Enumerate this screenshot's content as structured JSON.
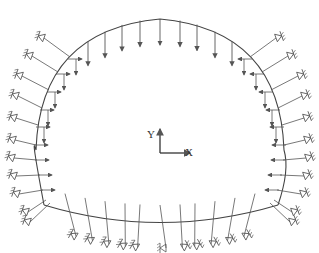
{
  "diagram": {
    "type": "tunnel-lining-load-model",
    "colors": {
      "stroke": "#555555",
      "lining": "#444444",
      "background": "#ffffff"
    },
    "axes": {
      "x_label": "X",
      "y_label": "Y",
      "origin": [
        160,
        153
      ],
      "x_len": 30,
      "y_len": 24
    },
    "lining": {
      "crown": [
        160,
        19
      ],
      "left_springline": [
        36,
        150
      ],
      "right_springline": [
        284,
        150
      ],
      "left_corner": [
        44,
        205
      ],
      "right_corner": [
        278,
        205
      ],
      "invert_bottom": [
        160,
        222
      ]
    },
    "vertical_loads_x": [
      88,
      105,
      122,
      140,
      160,
      180,
      197,
      215,
      232
    ],
    "lateral_load_count_per_side": 9,
    "arch_spring_count_per_side": 6,
    "wall_spring_count_per_side": 5,
    "invert_spring_count": 11
  }
}
